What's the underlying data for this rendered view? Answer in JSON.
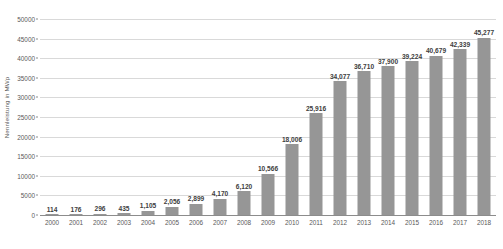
{
  "chart_data": {
    "type": "bar",
    "title": "",
    "subtitle": "",
    "xlabel": "",
    "ylabel": "Nennleistung in MWp",
    "ylim": [
      0,
      50000
    ],
    "ytick_step": 5000,
    "yticks": [
      0,
      5000,
      10000,
      15000,
      20000,
      25000,
      30000,
      35000,
      40000,
      45000,
      50000
    ],
    "ytick_labels": [
      "0",
      "5000",
      "10000",
      "15000",
      "20000",
      "25000",
      "30000",
      "35000",
      "40000",
      "45000",
      "50000"
    ],
    "grid": true,
    "legend": false,
    "legend_position": "none",
    "bar_color": "#969696",
    "gridline_color": "#d9d9d9",
    "axis_color": "#8c8c8c",
    "label_color": "#404040",
    "tick_color": "#595959",
    "categories": [
      "2000",
      "2001",
      "2002",
      "2003",
      "2004",
      "2005",
      "2006",
      "2007",
      "2008",
      "2009",
      "2010",
      "2011",
      "2012",
      "2013",
      "2014",
      "2015",
      "2016",
      "2017",
      "2018"
    ],
    "values": [
      114,
      176,
      296,
      435,
      1105,
      2056,
      2899,
      4170,
      6120,
      10566,
      18006,
      25916,
      34077,
      36710,
      37900,
      39224,
      40679,
      42339,
      45277
    ],
    "value_labels": [
      "114",
      "176",
      "296",
      "435",
      "1,105",
      "2,056",
      "2,899",
      "4,170",
      "6,120",
      "10,566",
      "18,006",
      "25,916",
      "34,077",
      "36,710",
      "37,900",
      "39,224",
      "40,679",
      "42,339",
      "45,277"
    ],
    "annotations": []
  }
}
